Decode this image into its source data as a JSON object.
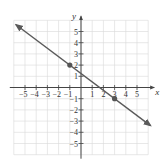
{
  "chart_data": {
    "type": "line",
    "title": "",
    "xlabel": "x",
    "ylabel": "y",
    "xlim": [
      -6,
      6
    ],
    "ylim": [
      -6,
      6
    ],
    "grid": true,
    "x_ticks": [
      -5,
      -4,
      -3,
      -2,
      -1,
      1,
      2,
      3,
      4,
      5
    ],
    "y_ticks": [
      -5,
      -4,
      -3,
      -2,
      -1,
      1,
      2,
      3,
      4,
      5
    ],
    "x_tick_labels": [
      "-5",
      "-4",
      "-3",
      "-2",
      "-1",
      "1",
      "2",
      "3",
      "4",
      "5"
    ],
    "y_tick_labels": [
      "-5",
      "-4",
      "-3",
      "-2",
      "-1",
      "1",
      "2",
      "3",
      "4",
      "5"
    ],
    "series": [
      {
        "name": "line",
        "slope": -0.75,
        "intercept": 1.25,
        "arrows": "both",
        "x": [
          -5.8,
          6.2
        ],
        "y": [
          5.6,
          -3.4
        ]
      }
    ],
    "points": [
      {
        "x": -1,
        "y": 2
      },
      {
        "x": 3,
        "y": -1
      }
    ],
    "colors": {
      "line": "#5a5a5a",
      "grid": "#d9d9d9",
      "axis": "#444444",
      "point": "#555555"
    }
  }
}
